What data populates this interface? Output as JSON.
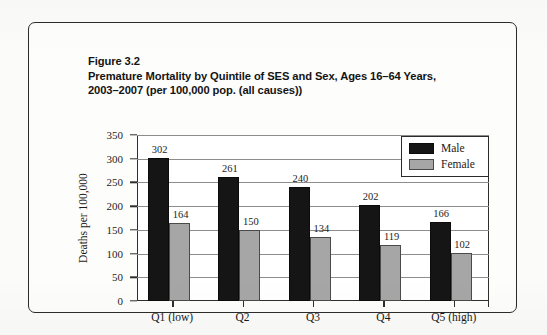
{
  "figure": {
    "caption_lines": [
      "Figure 3.2",
      "Premature Mortality by Quintile of SES and Sex, Ages 16–64 Years,",
      "2003–2007 (per 100,000 pop. (all causes))"
    ]
  },
  "colors": {
    "male": "#151515",
    "female": "#a6a6a6",
    "axis": "#2e2e2e",
    "grid": "#8d8d8d",
    "page": "#fdfdfb"
  },
  "chart_data": {
    "type": "bar",
    "title": "Premature Mortality by Quintile of SES and Sex, Ages 16–64 Years, 2003–2007 (per 100,000 pop. (all causes))",
    "xlabel": "",
    "ylabel": "Deaths per 100,000",
    "categories": [
      "Q1 (low)",
      "Q2",
      "Q3",
      "Q4",
      "Q5 (high)"
    ],
    "series": [
      {
        "name": "Male",
        "values": [
          302,
          261,
          240,
          202,
          166
        ]
      },
      {
        "name": "Female",
        "values": [
          164,
          150,
          134,
          119,
          102
        ]
      }
    ],
    "ylim": [
      0,
      350
    ],
    "yticks": [
      0,
      50,
      100,
      150,
      200,
      250,
      300,
      350
    ],
    "ytick_labels": [
      "0",
      "50",
      "100",
      "150",
      "200",
      "250",
      "300",
      "350"
    ],
    "grid": "horizontal",
    "legend_position": "top-right",
    "legend_entries": [
      "Male",
      "Female"
    ],
    "data_labels": true
  }
}
